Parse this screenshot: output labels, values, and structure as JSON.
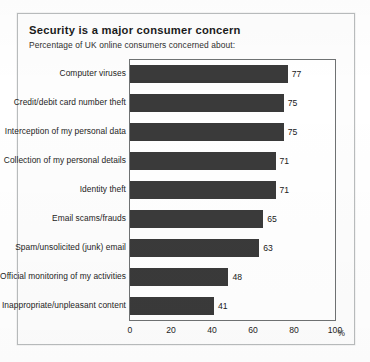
{
  "chart_data": {
    "type": "bar",
    "orientation": "horizontal",
    "title": "Security is a major consumer concern",
    "subtitle": "Percentage of UK online consumers concerned about:",
    "xlabel": "%",
    "ylabel": "",
    "xlim": [
      0,
      100
    ],
    "xticks": [
      "0",
      "20",
      "40",
      "60",
      "80",
      "100"
    ],
    "grid": false,
    "legend": "none",
    "bar_color": "#3a3a3a",
    "categories": [
      "Computer viruses",
      "Credit/debit card number theft",
      "Interception of my personal data",
      "Collection of my personal details",
      "Identity theft",
      "Email scams/frauds",
      "Spam/unsolicited (junk) email",
      "Official monitoring of my activities",
      "Inappropriate/unpleasant content"
    ],
    "values": [
      77,
      75,
      75,
      71,
      71,
      65,
      63,
      48,
      41
    ],
    "value_labels": [
      "77",
      "75",
      "75",
      "71",
      "71",
      "65",
      "63",
      "48",
      "41"
    ]
  }
}
